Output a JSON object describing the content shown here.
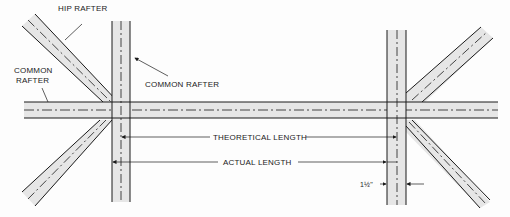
{
  "diagram": {
    "type": "rafter-framing-plan",
    "labels": {
      "hip_rafter": "HIP RAFTER",
      "common_rafter_left_line1": "COMMON",
      "common_rafter_left_line2": "RAFTER",
      "common_rafter_right": "COMMON RAFTER",
      "theoretical_length": "THEORETICAL LENGTH",
      "actual_length": "ACTUAL LENGTH",
      "thickness": "1½\""
    },
    "colors": {
      "line": "#1a1a1a",
      "member_fill": "#e6e6e6",
      "background": "#fdfdfd"
    }
  }
}
